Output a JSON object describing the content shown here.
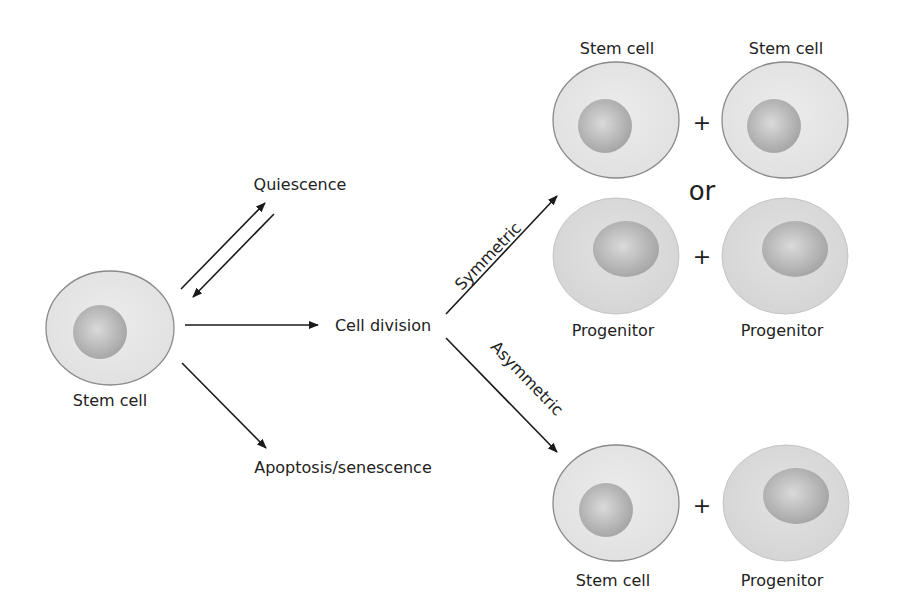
{
  "diagram": {
    "colors": {
      "cytoplasm": "#e6e6e6",
      "cytoplasm_progenitor": "#d9d9d9",
      "membrane": "#8a8a8a",
      "nucleus": "#a8a8a8",
      "nucleus_highlight": "#d2d2d2",
      "arrow": "#1a1a1a",
      "text": "#222222"
    },
    "source_cell": {
      "label": "Stem cell"
    },
    "fates": {
      "quiescence": "Quiescence",
      "cell_division": "Cell division",
      "apoptosis": "Apoptosis/senescence"
    },
    "division_modes": {
      "symmetric": "Symmetric",
      "asymmetric": "Asymmetric"
    },
    "symmetric_outcomes": {
      "option_a": {
        "left": "Stem cell",
        "right": "Stem cell"
      },
      "connector": "or",
      "option_b": {
        "left": "Progenitor",
        "right": "Progenitor"
      }
    },
    "asymmetric_outcome": {
      "left": "Stem cell",
      "right": "Progenitor"
    },
    "plus": "+"
  }
}
